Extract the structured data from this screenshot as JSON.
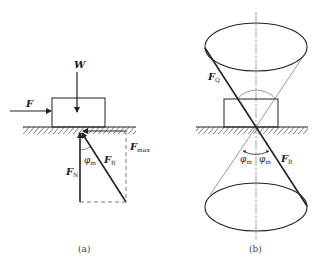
{
  "figure": {
    "panel_a": {
      "caption": "(a)",
      "labels": {
        "weight": "W",
        "applied_force": "F",
        "normal_force": "F",
        "normal_force_sub": "N",
        "resultant": "F",
        "resultant_sub": "R",
        "max_friction": "F",
        "max_friction_sub": "max",
        "friction_angle": "φ",
        "friction_angle_sub": "m"
      }
    },
    "panel_b": {
      "caption": "(b)",
      "labels": {
        "active_force": "F",
        "active_force_sub": "Q",
        "resultant": "F",
        "resultant_sub": "R",
        "angle_left": "φ",
        "angle_left_sub": "m",
        "angle_right": "φ",
        "angle_right_sub": "m"
      }
    },
    "colors": {
      "stroke": "#222222",
      "thin_stroke": "#555555",
      "background": "#ffffff"
    }
  }
}
